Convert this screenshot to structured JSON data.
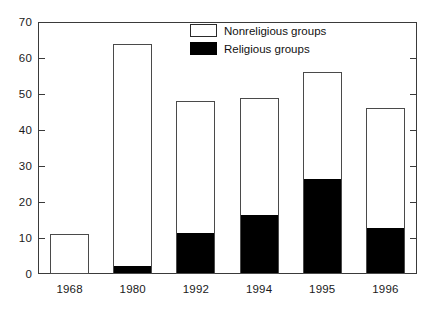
{
  "chart_data": {
    "type": "bar",
    "title": "",
    "subtitle": "",
    "xlabel": "",
    "ylabel": "",
    "categories": [
      "1968",
      "1980",
      "1992",
      "1994",
      "1995",
      "1996"
    ],
    "series": [
      {
        "name": "Religious groups",
        "color": "#000000",
        "values": [
          0,
          2,
          11,
          16,
          26,
          12.5
        ]
      },
      {
        "name": "Nonreligious groups",
        "color": "#ffffff",
        "values": [
          11,
          62,
          37,
          33,
          30,
          33.5
        ]
      }
    ],
    "totals": [
      11,
      64,
      48,
      49,
      56,
      46
    ],
    "stacked": true,
    "ylim": [
      0,
      70
    ],
    "yticks": [
      0,
      10,
      20,
      30,
      40,
      50,
      60,
      70
    ],
    "ytick_labels": [
      "0",
      "10",
      "20",
      "30",
      "40",
      "50",
      "60",
      "70"
    ],
    "grid": false,
    "legend_position": "top-center",
    "legend": [
      {
        "label": "Nonreligious groups",
        "swatch": "white"
      },
      {
        "label": "Religious groups",
        "swatch": "black"
      }
    ]
  }
}
